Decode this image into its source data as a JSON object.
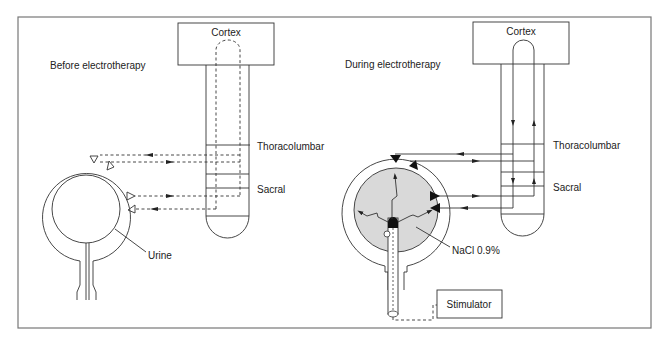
{
  "figure": {
    "panels": [
      {
        "id": "before",
        "title": "Before electrotherapy",
        "brain_label": "Cortex",
        "spinal_levels": [
          "Thoracolumbar",
          "Sacral"
        ],
        "bladder_content_label": "Urine",
        "pathway_style": "dashed"
      },
      {
        "id": "during",
        "title": "During electrotherapy",
        "brain_label": "Cortex",
        "spinal_levels": [
          "Thoracolumbar",
          "Sacral"
        ],
        "bladder_content_label": "NaCl 0.9%",
        "device_label": "Stimulator",
        "pathway_style": "solid"
      }
    ],
    "colors": {
      "line": "#333333",
      "frame": "#777777",
      "fluid_fill": "#d9d9d9",
      "electrode_tip": "#111111"
    }
  }
}
